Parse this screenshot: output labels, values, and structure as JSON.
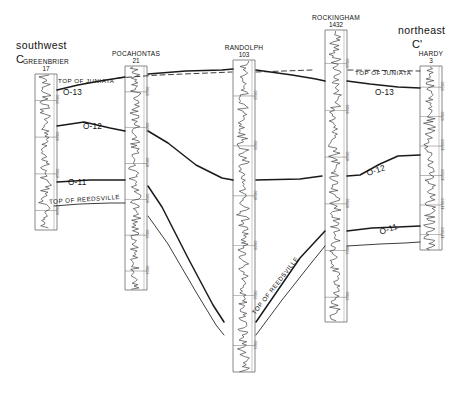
{
  "figure": {
    "type": "stratigraphic-cross-section",
    "orientation_left": "southwest",
    "orientation_right": "northeast",
    "section_start": "C",
    "section_end": "C'",
    "datum": "TOP OF JUNIATA"
  },
  "wells": [
    {
      "name": "GREENBRIER",
      "number": "17",
      "x": 46,
      "top": 74,
      "bottom": 230,
      "depths": [
        "9500",
        "9000",
        "8500",
        "8000"
      ]
    },
    {
      "name": "POCAHONTAS",
      "number": "21",
      "x": 136,
      "top": 66,
      "bottom": 290,
      "depths": [
        "9500",
        "9000",
        "8500",
        "8000",
        "7500",
        "7000"
      ]
    },
    {
      "name": "RANDOLPH",
      "number": "103",
      "x": 244,
      "top": 60,
      "bottom": 372,
      "depths": [
        "9500",
        "9000",
        "8500",
        "8000",
        "7500",
        "7000"
      ]
    },
    {
      "name": "ROCKINGHAM",
      "number": "1432",
      "x": 336,
      "top": 30,
      "bottom": 322,
      "depths": [
        "9500",
        "9000",
        "8500",
        "8000",
        "7500",
        "7000"
      ]
    },
    {
      "name": "HARDY",
      "number": "3",
      "x": 431,
      "top": 66,
      "bottom": 250,
      "depths": [
        "9500",
        "9000",
        "10000",
        "10500",
        "11000",
        "11500"
      ]
    }
  ],
  "horizons": [
    {
      "label": "TOP OF JUNIATA",
      "x": 58,
      "y": 77,
      "rotate": 0
    },
    {
      "label": "TOP OF JUNIATA",
      "x": 355,
      "y": 69,
      "rotate": 0
    },
    {
      "label": "TOP OF REEDSVILLE",
      "x": 49,
      "y": 198,
      "rotate": -4
    },
    {
      "label": "TOP OF REEDSVILLE",
      "x": 253,
      "y": 310,
      "rotate": -52
    }
  ],
  "markers": [
    {
      "label": "O-13",
      "x": 63,
      "y": 88,
      "rotate": 0
    },
    {
      "label": "O-12",
      "x": 83,
      "y": 122,
      "rotate": 0
    },
    {
      "label": "O-11",
      "x": 68,
      "y": 178,
      "rotate": 0
    },
    {
      "label": "O-13",
      "x": 375,
      "y": 88,
      "rotate": 0
    },
    {
      "label": "O-12",
      "x": 367,
      "y": 169,
      "rotate": -18
    },
    {
      "label": "O-11",
      "x": 380,
      "y": 228,
      "rotate": -20
    }
  ],
  "colors": {
    "line": "#1a1a1a",
    "track": "#6b6b6b",
    "curve": "#2a2a2a",
    "text": "#111111"
  }
}
